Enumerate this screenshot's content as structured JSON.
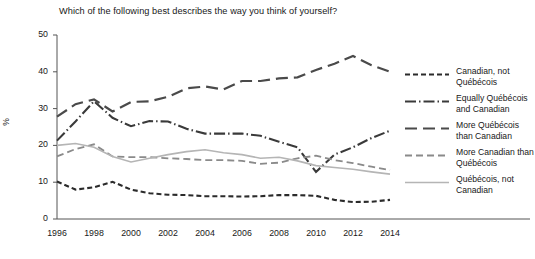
{
  "chart_data": {
    "type": "line",
    "title": "Which of the following best describes the way you think of yourself?",
    "xlabel": "",
    "ylabel": "%",
    "ylim": [
      0,
      50
    ],
    "yticks": [
      0,
      10,
      20,
      30,
      40,
      50
    ],
    "xlim": [
      1996,
      2014
    ],
    "xticks": [
      1996,
      1998,
      2000,
      2002,
      2004,
      2006,
      2008,
      2010,
      2012,
      2014
    ],
    "xtick_labels": [
      "1996",
      "1998",
      "2000",
      "2002",
      "2004",
      "2006",
      "2008",
      "2010",
      "2012",
      "2014"
    ],
    "ytick_labels": [
      "0",
      "10",
      "20",
      "30",
      "40",
      "50"
    ],
    "grid": false,
    "legend_position": "right",
    "x": [
      1996,
      1997,
      1998,
      1999,
      2000,
      2001,
      2002,
      2003,
      2004,
      2005,
      2006,
      2007,
      2008,
      2009,
      2010,
      2011,
      2012,
      2013,
      2014
    ],
    "series": [
      {
        "name": "Canadian, not Québécois",
        "color": "#2b2b2b",
        "dash": "5,3",
        "width": 2.1,
        "values": [
          10.2,
          8.0,
          8.6,
          10.1,
          8.0,
          7.0,
          6.6,
          6.5,
          6.2,
          6.2,
          6.1,
          6.2,
          6.5,
          6.5,
          6.3,
          5.2,
          4.6,
          4.7,
          5.2
        ]
      },
      {
        "name": "Equally Québécois and Canadian",
        "color": "#3a3a3a",
        "dash": "11,3,1.5,3",
        "width": 2.1,
        "values": [
          21.3,
          26.5,
          32.0,
          27.5,
          25.2,
          26.6,
          26.5,
          24.5,
          23.2,
          23.2,
          23.2,
          22.6,
          21.0,
          19.5,
          12.8,
          17.5,
          19.5,
          22.0,
          24.0
        ]
      },
      {
        "name": "More Québécois than Canadian",
        "color": "#4a4a4a",
        "dash": "12,6",
        "width": 2.2,
        "values": [
          27.8,
          31.2,
          32.5,
          29.2,
          31.8,
          32.0,
          33.2,
          35.5,
          36.0,
          35.2,
          37.5,
          37.5,
          38.2,
          38.5,
          40.5,
          42.2,
          44.3,
          41.8,
          40.0
        ]
      },
      {
        "name": "More Canadian than Québécois",
        "color": "#8a8a8a",
        "dash": "7,4",
        "width": 1.8,
        "values": [
          17.0,
          19.0,
          20.3,
          17.0,
          16.8,
          16.8,
          16.5,
          16.3,
          16.0,
          16.0,
          15.8,
          15.0,
          15.3,
          16.5,
          17.2,
          16.0,
          15.2,
          14.2,
          13.3
        ]
      },
      {
        "name": "Québécois, not Canadian",
        "color": "#b5b5b5",
        "dash": "none",
        "width": 1.6,
        "values": [
          20.0,
          20.5,
          19.5,
          17.0,
          15.5,
          16.5,
          17.5,
          18.3,
          18.8,
          18.0,
          17.5,
          16.5,
          16.8,
          15.8,
          14.5,
          14.0,
          13.5,
          12.8,
          12.2
        ]
      }
    ]
  },
  "legend": {
    "items": [
      {
        "label": "Canadian, not Québécois"
      },
      {
        "label": "Equally Québécois and Canadian"
      },
      {
        "label": "More Québécois than Canadian"
      },
      {
        "label": "More Canadian than Québécois"
      },
      {
        "label": "Québécois, not Canadian"
      }
    ]
  }
}
